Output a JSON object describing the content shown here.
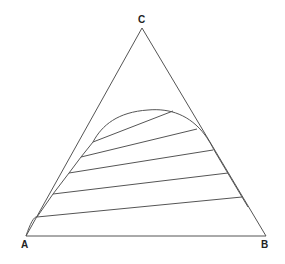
{
  "diagram": {
    "type": "ternary-phase-diagram",
    "vertices": {
      "A": {
        "label": "A",
        "x": 26,
        "y": 236
      },
      "B": {
        "label": "B",
        "x": 266,
        "y": 236
      },
      "C": {
        "label": "C",
        "x": 142,
        "y": 28
      }
    },
    "line_color": "#555555",
    "binodal_curve": "M 26 236 C 30 224, 34 216, 37 217 L 53 194 L 69 173 L 81 157 L 93 142 C 102 125, 118 112, 148 110 C 170 108, 190 115, 205 135 C 210 142, 213 148, 214 150 L 242 197 L 248 207",
    "tie_lines": [
      {
        "x1": 93,
        "y1": 142,
        "x2": 173,
        "y2": 111
      },
      {
        "x1": 81,
        "y1": 157,
        "x2": 197,
        "y2": 129
      },
      {
        "x1": 69,
        "y1": 173,
        "x2": 213,
        "y2": 150
      },
      {
        "x1": 53,
        "y1": 194,
        "x2": 228,
        "y2": 173
      },
      {
        "x1": 37,
        "y1": 217,
        "x2": 242,
        "y2": 197
      }
    ]
  }
}
